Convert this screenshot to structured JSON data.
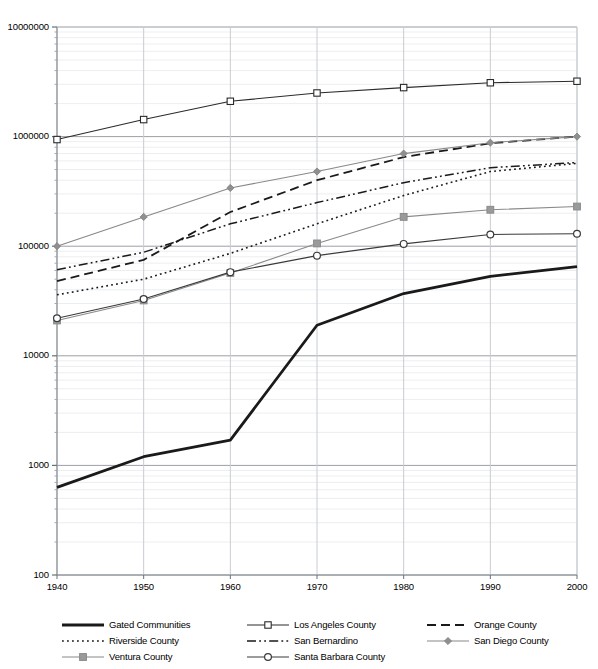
{
  "chart_data": {
    "type": "line",
    "title": "",
    "xlabel": "",
    "ylabel": "",
    "log_y": true,
    "ylim": [
      100,
      10000000
    ],
    "xlim": [
      1940,
      2000
    ],
    "grid": true,
    "grid_minor": true,
    "legend_position": "below",
    "x": [
      1940,
      1950,
      1960,
      1970,
      1980,
      1990,
      2000
    ],
    "categories": [
      "1940",
      "1950",
      "1960",
      "1970",
      "1980",
      "1990",
      "2000"
    ],
    "y_ticks": [
      100,
      1000,
      10000,
      100000,
      1000000,
      10000000
    ],
    "y_tick_labels": [
      "100",
      "1000",
      "10000",
      "100000",
      "1000000",
      "10000000"
    ],
    "series": [
      {
        "name": "Gated Communities",
        "color": "#1a1a1a",
        "style": "solid",
        "width": 2.8,
        "marker": "none",
        "values": [
          630,
          1200,
          1700,
          19000,
          37000,
          53000,
          65000
        ]
      },
      {
        "name": "Los Angeles County",
        "color": "#2b2b2b",
        "style": "solid",
        "width": 1.1,
        "marker": "square-open",
        "values": [
          940000,
          1430000,
          2100000,
          2500000,
          2800000,
          3100000,
          3200000
        ]
      },
      {
        "name": "Orange County",
        "color": "#1a1a1a",
        "style": "dashed",
        "width": 1.8,
        "marker": "none",
        "values": [
          48000,
          75000,
          205000,
          400000,
          650000,
          870000,
          1000000
        ]
      },
      {
        "name": "Riverside County",
        "color": "#1a1a1a",
        "style": "dotted",
        "width": 1.6,
        "marker": "none",
        "values": [
          36000,
          50000,
          86000,
          160000,
          290000,
          480000,
          570000
        ]
      },
      {
        "name": "San Bernardino",
        "color": "#1a1a1a",
        "style": "dashdot",
        "width": 1.5,
        "marker": "none",
        "values": [
          61000,
          88000,
          160000,
          250000,
          380000,
          520000,
          580000
        ]
      },
      {
        "name": "San Diego County",
        "color": "#888888",
        "style": "solid",
        "width": 1.1,
        "marker": "diamond",
        "values": [
          100000,
          185000,
          340000,
          480000,
          700000,
          880000,
          1000000
        ]
      },
      {
        "name": "Ventura County",
        "color": "#8a8a8a",
        "style": "solid",
        "width": 1.1,
        "marker": "square-filled",
        "values": [
          21000,
          32000,
          57000,
          106000,
          185000,
          215000,
          230000
        ]
      },
      {
        "name": "Santa Barbara County",
        "color": "#3a3a3a",
        "style": "solid",
        "width": 1.1,
        "marker": "circle-open",
        "values": [
          22000,
          33000,
          58000,
          82000,
          105000,
          128000,
          130000
        ]
      }
    ]
  },
  "legend": {
    "rows": [
      [
        {
          "name": "Gated Communities",
          "key": "gated-communities"
        },
        {
          "name": "Los Angeles County",
          "key": "los-angeles-county"
        },
        {
          "name": "Orange County",
          "key": "orange-county"
        }
      ],
      [
        {
          "name": "Riverside County",
          "key": "riverside-county"
        },
        {
          "name": "San Bernardino",
          "key": "san-bernardino"
        },
        {
          "name": "San Diego County",
          "key": "san-diego-county"
        }
      ],
      [
        {
          "name": "Ventura County",
          "key": "ventura-county"
        },
        {
          "name": "Santa Barbara County",
          "key": "santa-barbara-county"
        }
      ]
    ]
  }
}
